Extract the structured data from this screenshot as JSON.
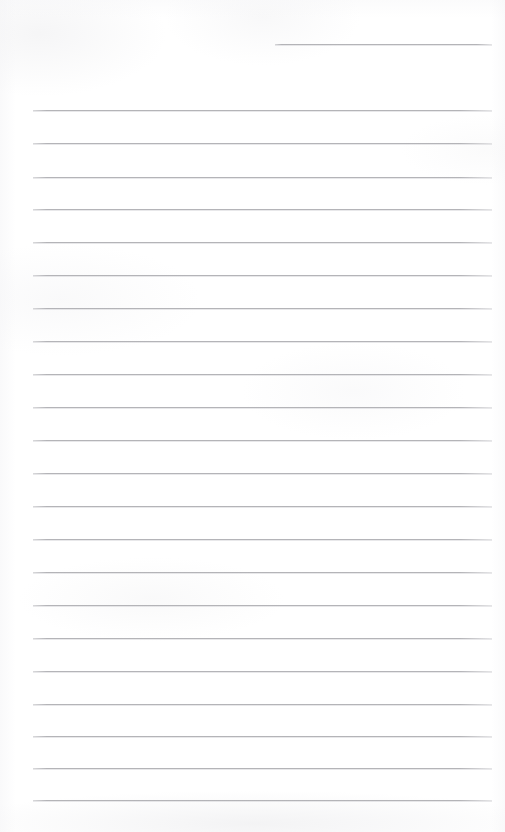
{
  "document": {
    "type": "lined-paper",
    "title": "Blank ruled notepad page",
    "page_width": 505,
    "page_height": 832,
    "background_color": "#ffffff",
    "rule_color": "#c2c2c4",
    "text_content": "",
    "has_handwriting": false,
    "has_printed_text": false,
    "notes": "Empty scanned sheet of ruled writing paper. No text, headings, numbers or labels are present anywhere on the page."
  },
  "ruling": {
    "full_rule_count": 22,
    "partial_rule_count": 1,
    "total_rule_count": 23,
    "line_spacing_px": 33.5,
    "margin_left_px": 33,
    "margin_right_px": 492,
    "first_full_rule_y_px": 110,
    "last_full_rule_y_px": 800,
    "stroke_width_px": 1,
    "rules": [
      {
        "id": "rule-top-partial",
        "y": 44,
        "x1": 275,
        "x2": 492,
        "partial": true
      },
      {
        "id": "rule-01",
        "y": 110,
        "x1": 33,
        "x2": 492,
        "partial": false
      },
      {
        "id": "rule-02",
        "y": 143,
        "x1": 33,
        "x2": 492,
        "partial": false
      },
      {
        "id": "rule-03",
        "y": 177,
        "x1": 33,
        "x2": 492,
        "partial": false
      },
      {
        "id": "rule-04",
        "y": 209,
        "x1": 33,
        "x2": 492,
        "partial": false
      },
      {
        "id": "rule-05",
        "y": 242,
        "x1": 33,
        "x2": 492,
        "partial": false
      },
      {
        "id": "rule-06",
        "y": 275,
        "x1": 33,
        "x2": 492,
        "partial": false
      },
      {
        "id": "rule-07",
        "y": 308,
        "x1": 33,
        "x2": 492,
        "partial": false
      },
      {
        "id": "rule-08",
        "y": 341,
        "x1": 33,
        "x2": 492,
        "partial": false
      },
      {
        "id": "rule-09",
        "y": 374,
        "x1": 33,
        "x2": 492,
        "partial": false
      },
      {
        "id": "rule-10",
        "y": 407,
        "x1": 33,
        "x2": 492,
        "partial": false
      },
      {
        "id": "rule-11",
        "y": 440,
        "x1": 33,
        "x2": 492,
        "partial": false
      },
      {
        "id": "rule-12",
        "y": 473,
        "x1": 33,
        "x2": 492,
        "partial": false
      },
      {
        "id": "rule-13",
        "y": 506,
        "x1": 33,
        "x2": 492,
        "partial": false
      },
      {
        "id": "rule-14",
        "y": 539,
        "x1": 33,
        "x2": 492,
        "partial": false
      },
      {
        "id": "rule-15",
        "y": 572,
        "x1": 33,
        "x2": 492,
        "partial": false
      },
      {
        "id": "rule-16",
        "y": 605,
        "x1": 33,
        "x2": 492,
        "partial": false
      },
      {
        "id": "rule-17",
        "y": 638,
        "x1": 33,
        "x2": 492,
        "partial": false
      },
      {
        "id": "rule-18",
        "y": 671,
        "x1": 33,
        "x2": 492,
        "partial": false
      },
      {
        "id": "rule-19",
        "y": 704,
        "x1": 33,
        "x2": 492,
        "partial": false
      },
      {
        "id": "rule-20",
        "y": 736,
        "x1": 33,
        "x2": 492,
        "partial": false
      },
      {
        "id": "rule-21",
        "y": 768,
        "x1": 33,
        "x2": 492,
        "partial": false
      },
      {
        "id": "rule-22",
        "y": 800,
        "x1": 33,
        "x2": 492,
        "partial": false
      }
    ]
  }
}
